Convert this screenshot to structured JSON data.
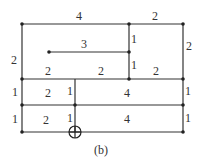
{
  "caption": "(b)",
  "stroke_color": "#333333",
  "nodes": [
    {
      "id": "A",
      "x": 22,
      "y": 24
    },
    {
      "id": "B",
      "x": 129,
      "y": 24
    },
    {
      "id": "C",
      "x": 183,
      "y": 24
    },
    {
      "id": "D",
      "x": 49,
      "y": 52
    },
    {
      "id": "E",
      "x": 129,
      "y": 52
    },
    {
      "id": "F",
      "x": 22,
      "y": 79
    },
    {
      "id": "G",
      "x": 129,
      "y": 79
    },
    {
      "id": "H",
      "x": 183,
      "y": 79
    },
    {
      "id": "I",
      "x": 22,
      "y": 105
    },
    {
      "id": "J",
      "x": 75,
      "y": 105
    },
    {
      "id": "K",
      "x": 183,
      "y": 105
    },
    {
      "id": "L",
      "x": 22,
      "y": 132
    },
    {
      "id": "M",
      "x": 75,
      "y": 132,
      "marker": "circled-plus"
    },
    {
      "id": "N",
      "x": 183,
      "y": 132
    }
  ],
  "edge_labels": [
    {
      "text": "4",
      "x": 79,
      "y": 20
    },
    {
      "text": "2",
      "x": 155,
      "y": 20
    },
    {
      "text": "2",
      "x": 14,
      "y": 64
    },
    {
      "text": "3",
      "x": 84,
      "y": 48
    },
    {
      "text": "1",
      "x": 134,
      "y": 43
    },
    {
      "text": "1",
      "x": 134,
      "y": 69
    },
    {
      "text": "2",
      "x": 189,
      "y": 50
    },
    {
      "text": "2",
      "x": 48,
      "y": 75
    },
    {
      "text": "2",
      "x": 101,
      "y": 75
    },
    {
      "text": "2",
      "x": 156,
      "y": 75
    },
    {
      "text": "1",
      "x": 15,
      "y": 96
    },
    {
      "text": "2",
      "x": 48,
      "y": 97
    },
    {
      "text": "1",
      "x": 70,
      "y": 95
    },
    {
      "text": "4",
      "x": 127,
      "y": 97
    },
    {
      "text": "1",
      "x": 188,
      "y": 95
    },
    {
      "text": "1",
      "x": 15,
      "y": 123
    },
    {
      "text": "2",
      "x": 46,
      "y": 124
    },
    {
      "text": "1",
      "x": 70,
      "y": 122
    },
    {
      "text": "4",
      "x": 127,
      "y": 123
    },
    {
      "text": "1",
      "x": 188,
      "y": 122
    }
  ]
}
